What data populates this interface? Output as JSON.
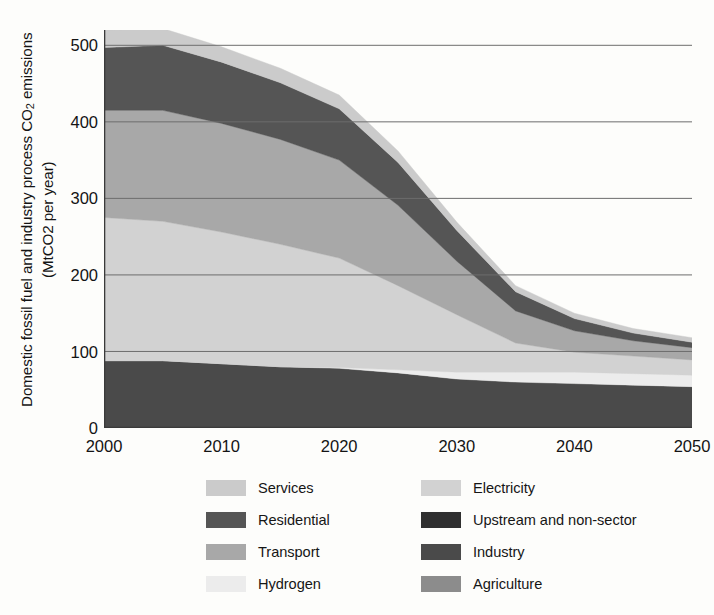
{
  "chart_data": {
    "type": "area",
    "stacked": true,
    "title": "",
    "xlabel": "",
    "ylabel": "Domestic fossil fuel and industry process CO2 emissions (MtCO2 per year)",
    "ylabel_line1": "Domestic fossil fuel and industry process CO",
    "ylabel_sub": "2",
    "ylabel_line1_tail": " emissions",
    "ylabel_line2": "(MtCO2  per year)",
    "x": [
      2000,
      2005,
      2010,
      2015,
      2020,
      2025,
      2030,
      2035,
      2040,
      2045,
      2050
    ],
    "xlim": [
      2000,
      2050
    ],
    "ylim": [
      0,
      520
    ],
    "xticks": [
      2000,
      2010,
      2020,
      2030,
      2040,
      2050
    ],
    "xticklabels": [
      "2000",
      "2010",
      "2020",
      "2030",
      "2040",
      "2050"
    ],
    "xminorticks": [
      2005,
      2015,
      2025,
      2035,
      2045
    ],
    "yticks": [
      0,
      100,
      200,
      300,
      400,
      500
    ],
    "yticklabels": [
      "0",
      "100",
      "200",
      "300",
      "400",
      "500"
    ],
    "grid": "horizontal",
    "gridlines": [
      100,
      200,
      300,
      400,
      500
    ],
    "legend_position": "below",
    "stack_order_bottom_to_top": [
      "Industry",
      "Hydrogen",
      "Electricity",
      "Transport",
      "Residential",
      "Services"
    ],
    "series": [
      {
        "name": "Industry",
        "color": "#4a4a4a",
        "values": [
          88,
          88,
          84,
          80,
          78,
          72,
          64,
          60,
          58,
          56,
          54
        ]
      },
      {
        "name": "Hydrogen",
        "color": "#ececec",
        "values": [
          0,
          0,
          0,
          0,
          1,
          4,
          9,
          13,
          15,
          15,
          15
        ]
      },
      {
        "name": "Electricity",
        "color": "#d2d2d2",
        "values": [
          187,
          182,
          172,
          160,
          143,
          110,
          75,
          38,
          26,
          23,
          20
        ]
      },
      {
        "name": "Transport",
        "color": "#a8a8a8",
        "values": [
          140,
          145,
          142,
          137,
          128,
          105,
          70,
          42,
          28,
          20,
          16
        ]
      },
      {
        "name": "Residential",
        "color": "#555555",
        "values": [
          82,
          85,
          80,
          74,
          67,
          56,
          40,
          25,
          16,
          10,
          7
        ]
      },
      {
        "name": "Services",
        "color": "#cbcbcb",
        "values": [
          23,
          22,
          20,
          19,
          18,
          15,
          11,
          8,
          7,
          6,
          6
        ]
      },
      {
        "name": "Upstream and non-sector",
        "color": "#2f2f2f",
        "values": [
          0,
          0,
          0,
          0,
          0,
          0,
          0,
          0,
          0,
          0,
          0
        ]
      },
      {
        "name": "Agriculture",
        "color": "#8c8c8c",
        "values": [
          0,
          0,
          0,
          0,
          0,
          0,
          0,
          0,
          0,
          0,
          0
        ]
      }
    ],
    "totals": [
      520,
      522,
      498,
      470,
      435,
      362,
      269,
      186,
      150,
      130,
      118
    ]
  },
  "legend": {
    "columns": [
      {
        "items": [
          {
            "label": "Services",
            "color": "#cbcbcb"
          },
          {
            "label": "Residential",
            "color": "#555555"
          },
          {
            "label": "Transport",
            "color": "#a8a8a8"
          },
          {
            "label": "Hydrogen",
            "color": "#ececec"
          }
        ]
      },
      {
        "items": [
          {
            "label": "Electricity",
            "color": "#d2d2d2"
          },
          {
            "label": "Upstream and non-sector",
            "color": "#2f2f2f"
          },
          {
            "label": "Industry",
            "color": "#4a4a4a"
          },
          {
            "label": "Agriculture",
            "color": "#8c8c8c"
          }
        ]
      }
    ]
  },
  "axis": {
    "spine_color": "#3a3a3a",
    "grid_color": "#6d6d6d",
    "tick_color": "#3a3a3a"
  }
}
